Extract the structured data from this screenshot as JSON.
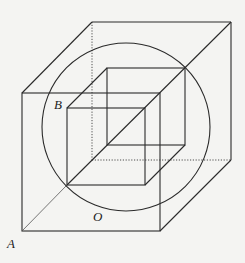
{
  "diagram": {
    "type": "geometry",
    "labels": {
      "A": "A",
      "B": "B",
      "O": "O"
    },
    "colors": {
      "background": "#f4f4f2",
      "stroke": "#2a2a2a"
    },
    "outer_cube": {
      "front_face": [
        [
          22,
          93
        ],
        [
          160,
          93
        ],
        [
          160,
          231
        ],
        [
          22,
          231
        ]
      ],
      "back_face": [
        [
          92,
          22
        ],
        [
          231,
          22
        ],
        [
          231,
          160
        ],
        [
          92,
          160
        ]
      ],
      "hidden_edges": [
        [
          [
            92,
            22
          ],
          [
            92,
            160
          ]
        ],
        [
          [
            92,
            160
          ],
          [
            231,
            160
          ]
        ]
      ]
    },
    "inner_cube": {
      "front_face": [
        [
          67,
          108
        ],
        [
          145,
          108
        ],
        [
          145,
          185
        ],
        [
          67,
          185
        ]
      ],
      "back_face": [
        [
          107,
          68
        ],
        [
          185,
          68
        ],
        [
          185,
          145
        ],
        [
          107,
          145
        ]
      ]
    },
    "sphere": {
      "center": [
        126,
        127
      ],
      "radius": 84
    },
    "diagonal": {
      "from": [
        22,
        231
      ],
      "to": [
        231,
        22
      ]
    }
  }
}
